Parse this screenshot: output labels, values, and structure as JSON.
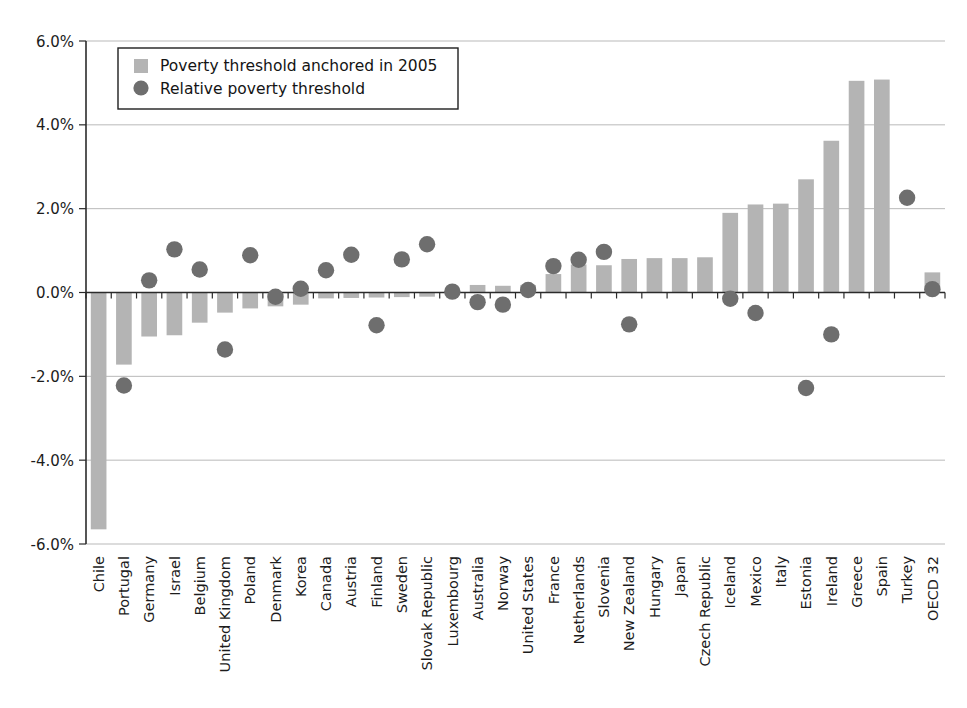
{
  "chart_data": {
    "type": "bar",
    "title": "",
    "subtitle": "",
    "xlabel": "",
    "ylabel": "",
    "ylim": [
      -6.0,
      6.0
    ],
    "yticks": [
      6.0,
      4.0,
      2.0,
      0.0,
      -2.0,
      -4.0,
      -6.0
    ],
    "ytick_labels": [
      "6.0%",
      "4.0%",
      "2.0%",
      "0.0%",
      "-2.0%",
      "-4.0%",
      "-6.0%"
    ],
    "grid": true,
    "legend_position": "upper-left-inside",
    "value_suffix": "%",
    "categories": [
      "Chile",
      "Portugal",
      "Germany",
      "Israel",
      "Belgium",
      "United Kingdom",
      "Poland",
      "Denmark",
      "Korea",
      "Canada",
      "Austria",
      "Finland",
      "Sweden",
      "Slovak Republic",
      "Luxembourg",
      "Australia",
      "Norway",
      "United States",
      "France",
      "Netherlands",
      "Slovenia",
      "New Zealand",
      "Hungary",
      "Japan",
      "Czech Republic",
      "Iceland",
      "Mexico",
      "Italy",
      "Estonia",
      "Ireland",
      "Greece",
      "Spain",
      "Turkey",
      "OECD 32"
    ],
    "series": [
      {
        "name": "Poverty threshold anchored in 2005",
        "kind": "bar",
        "color": "#b4b4b4",
        "values": [
          -5.65,
          -1.72,
          -1.05,
          -1.02,
          -0.72,
          -0.48,
          -0.38,
          -0.33,
          -0.29,
          -0.14,
          -0.13,
          -0.12,
          -0.11,
          -0.1,
          0.04,
          0.18,
          0.16,
          0.18,
          0.44,
          0.67,
          0.65,
          0.8,
          0.82,
          0.82,
          0.84,
          1.9,
          2.1,
          2.12,
          2.7,
          3.62,
          5.05,
          5.08,
          null,
          0.48
        ]
      },
      {
        "name": "Relative poverty threshold",
        "kind": "scatter",
        "color": "#6e6e6e",
        "values": [
          null,
          -2.22,
          0.29,
          1.03,
          0.55,
          -1.36,
          0.89,
          -0.1,
          0.09,
          0.53,
          0.9,
          -0.78,
          0.79,
          1.15,
          0.02,
          -0.23,
          -0.29,
          0.06,
          0.63,
          0.78,
          0.97,
          -0.76,
          null,
          null,
          null,
          -0.15,
          -0.49,
          null,
          -2.28,
          -1.0,
          null,
          null,
          2.26,
          0.08
        ]
      }
    ]
  },
  "legend": {
    "entries": [
      {
        "label": "Poverty threshold anchored in 2005",
        "marker": "square-swatch"
      },
      {
        "label": "Relative poverty threshold",
        "marker": "circle-swatch"
      }
    ]
  },
  "colors": {
    "bar": "#b4b4b4",
    "dot": "#6e6e6e",
    "axis": "#2b2b2b",
    "grid": "#b9b9b9",
    "text": "#1c1c1c",
    "background": "#ffffff"
  }
}
